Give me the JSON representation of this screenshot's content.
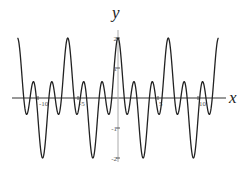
{
  "chart_data": {
    "type": "line",
    "title": "",
    "xlabel": "x",
    "ylabel": "y",
    "function": "cos(x) + cos(3x)",
    "xlim": [
      -12.566,
      12.566
    ],
    "ylim": [
      -2,
      2
    ],
    "x_ticks": [
      -10,
      -5,
      5,
      10
    ],
    "x_tick_labels": [
      "-10",
      "-5",
      "5",
      "10"
    ],
    "y_ticks": [
      2,
      1,
      -1,
      -2
    ],
    "y_tick_labels": [
      "2",
      "1",
      "-1",
      "-2"
    ],
    "grid": false,
    "legend": null,
    "series": [
      {
        "name": "f(x)",
        "color": "#222222",
        "x": [
          -12.57,
          -9.42,
          -6.28,
          -3.14,
          0,
          3.14,
          6.28,
          9.42,
          12.57
        ],
        "y": [
          2,
          -2,
          2,
          -2,
          2,
          -2,
          2,
          -2,
          2
        ]
      }
    ],
    "annotations": []
  }
}
